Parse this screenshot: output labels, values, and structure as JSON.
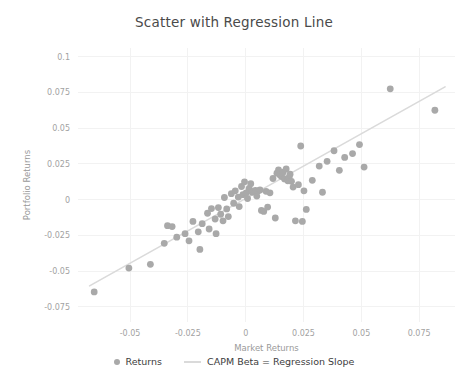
{
  "chart_data": {
    "type": "scatter",
    "title": "Scatter with Regression Line",
    "xlabel": "Market Returns",
    "ylabel": "Portfolio Returns",
    "xlim": [
      -0.0725,
      0.0905
    ],
    "ylim": [
      -0.0855,
      0.106
    ],
    "xticks": [
      -0.05,
      -0.025,
      0,
      0.025,
      0.05,
      0.075
    ],
    "xticklabels": [
      "-0.05",
      "-0.025",
      "0",
      "0.025",
      "0.05",
      "0.075"
    ],
    "yticks": [
      0.1,
      0.075,
      0.05,
      0.025,
      0,
      -0.025,
      -0.05,
      -0.075
    ],
    "yticklabels": [
      "0.1",
      "0.075",
      "0.05",
      "0.025",
      "0",
      "-0.025",
      "-0.05",
      "-0.075"
    ],
    "grid": true,
    "legend_position": "bottom",
    "marker_color": "#a9a9a9",
    "line_color": "#dadada",
    "marker_size": 3.4,
    "series": [
      {
        "name": "Returns",
        "type": "scatter",
        "points": [
          [
            -0.0655,
            -0.0645
          ],
          [
            -0.0505,
            -0.0478
          ],
          [
            -0.0412,
            -0.0452
          ],
          [
            -0.0352,
            -0.0305
          ],
          [
            -0.0338,
            -0.0182
          ],
          [
            -0.0318,
            -0.0188
          ],
          [
            -0.0298,
            -0.0262
          ],
          [
            -0.0262,
            -0.0238
          ],
          [
            -0.0245,
            -0.0288
          ],
          [
            -0.0228,
            -0.0152
          ],
          [
            -0.0205,
            -0.0225
          ],
          [
            -0.0198,
            -0.0348
          ],
          [
            -0.0188,
            -0.0168
          ],
          [
            -0.0165,
            -0.0095
          ],
          [
            -0.0158,
            -0.0205
          ],
          [
            -0.0148,
            -0.0062
          ],
          [
            -0.0132,
            -0.0135
          ],
          [
            -0.0128,
            -0.0238
          ],
          [
            -0.0118,
            -0.0055
          ],
          [
            -0.0108,
            -0.0102
          ],
          [
            -0.0098,
            -0.0148
          ],
          [
            -0.0092,
            0.0015
          ],
          [
            -0.0082,
            -0.0065
          ],
          [
            -0.0075,
            -0.0118
          ],
          [
            -0.0062,
            0.0042
          ],
          [
            -0.0052,
            -0.0025
          ],
          [
            -0.0045,
            0.0062
          ],
          [
            -0.0032,
            0.0018
          ],
          [
            -0.0028,
            -0.0048
          ],
          [
            -0.0018,
            0.0092
          ],
          [
            -0.0012,
            0.0035
          ],
          [
            -0.0005,
            0.0125
          ],
          [
            0.0002,
            0.0048
          ],
          [
            0.0008,
            0.0008
          ],
          [
            0.0015,
            0.0078
          ],
          [
            0.0022,
            0.0112
          ],
          [
            0.0028,
            0.0052
          ],
          [
            0.0035,
            0.0058
          ],
          [
            0.0042,
            0.0065
          ],
          [
            0.0048,
            0.0025
          ],
          [
            0.0055,
            0.0062
          ],
          [
            0.0062,
            0.0068
          ],
          [
            0.0068,
            -0.0075
          ],
          [
            0.0078,
            -0.0082
          ],
          [
            0.0088,
            0.0058
          ],
          [
            0.0095,
            -0.0052
          ],
          [
            0.0105,
            0.0048
          ],
          [
            0.0118,
            0.0148
          ],
          [
            0.0128,
            -0.0128
          ],
          [
            0.0135,
            0.0185
          ],
          [
            0.0142,
            0.0208
          ],
          [
            0.0148,
            0.0172
          ],
          [
            0.0155,
            0.0162
          ],
          [
            0.0162,
            0.0192
          ],
          [
            0.0168,
            0.0145
          ],
          [
            0.0175,
            0.0215
          ],
          [
            0.0182,
            0.0132
          ],
          [
            0.0188,
            0.0155
          ],
          [
            0.0192,
            0.0178
          ],
          [
            0.0198,
            0.0128
          ],
          [
            0.0205,
            0.0088
          ],
          [
            0.0215,
            -0.0148
          ],
          [
            0.0228,
            0.0105
          ],
          [
            0.0238,
            0.0375
          ],
          [
            0.0245,
            -0.0152
          ],
          [
            0.0252,
            0.0062
          ],
          [
            0.0262,
            -0.0068
          ],
          [
            0.0288,
            0.0135
          ],
          [
            0.0318,
            0.0235
          ],
          [
            0.0332,
            0.0052
          ],
          [
            0.0352,
            0.0268
          ],
          [
            0.0382,
            0.0342
          ],
          [
            0.0405,
            0.0205
          ],
          [
            0.0428,
            0.0295
          ],
          [
            0.0462,
            0.0322
          ],
          [
            0.0492,
            0.0385
          ],
          [
            0.0512,
            0.0228
          ],
          [
            0.0625,
            0.0775
          ],
          [
            0.0818,
            0.0625
          ]
        ]
      },
      {
        "name": "CAPM Beta = Regression Slope",
        "type": "line",
        "slope": 0.905,
        "intercept": 0.0008,
        "x_endpoints": [
          -0.0675,
          0.0862
        ]
      }
    ]
  },
  "legend": {
    "entries": [
      {
        "label": "Returns",
        "marker": "dot",
        "color": "#a9a9a9"
      },
      {
        "label": "CAPM Beta = Regression Slope",
        "marker": "line",
        "color": "#dadada"
      }
    ]
  }
}
